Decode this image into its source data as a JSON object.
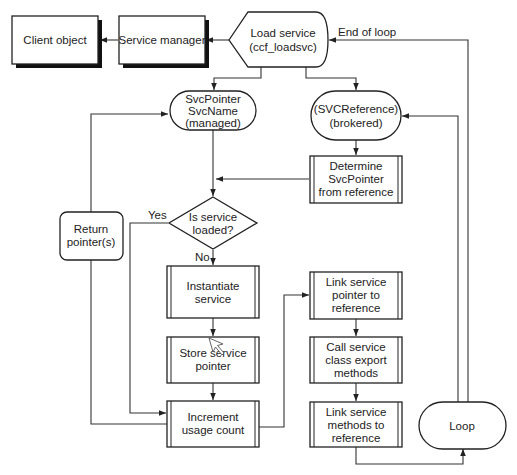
{
  "diagram": {
    "type": "flowchart",
    "nodes": {
      "client_object": {
        "label": "Client object",
        "shape": "shadowed-rectangle"
      },
      "service_manager": {
        "label": "Service manager",
        "shape": "shadowed-rectangle"
      },
      "load_service": {
        "lines": [
          "Load service",
          "(ccf_loadsvc)"
        ],
        "shape": "display"
      },
      "svc_managed": {
        "lines": [
          "SvcPointer",
          "SvcName",
          "(managed)"
        ],
        "shape": "terminator"
      },
      "svc_brokered": {
        "lines": [
          "(SVCReference)",
          "(brokered)"
        ],
        "shape": "terminator"
      },
      "determine_pointer": {
        "lines": [
          "Determine",
          "SvcPointer",
          "from reference"
        ],
        "shape": "predefined-process"
      },
      "is_loaded": {
        "lines": [
          "Is service",
          "loaded?"
        ],
        "shape": "decision"
      },
      "return_pointers": {
        "lines": [
          "Return",
          "pointer(s)"
        ],
        "shape": "rounded-rectangle"
      },
      "instantiate": {
        "lines": [
          "Instantiate",
          "service"
        ],
        "shape": "predefined-process"
      },
      "store_pointer": {
        "lines": [
          "Store service",
          "pointer"
        ],
        "shape": "predefined-process"
      },
      "increment": {
        "lines": [
          "Increment",
          "usage count"
        ],
        "shape": "predefined-process"
      },
      "link_pointer": {
        "lines": [
          "Link service",
          "pointer to",
          "reference"
        ],
        "shape": "predefined-process"
      },
      "call_export": {
        "lines": [
          "Call service",
          "class export",
          "methods"
        ],
        "shape": "predefined-process"
      },
      "link_methods": {
        "lines": [
          "Link service",
          "methods to",
          "reference"
        ],
        "shape": "predefined-process"
      },
      "loop": {
        "label": "Loop",
        "shape": "terminator"
      }
    },
    "edge_labels": {
      "end_of_loop": "End of loop",
      "yes": "Yes",
      "no": "No"
    },
    "edges": [
      [
        "load_service",
        "service_manager"
      ],
      [
        "service_manager",
        "client_object"
      ],
      [
        "load_service",
        "svc_managed"
      ],
      [
        "load_service",
        "svc_brokered"
      ],
      [
        "svc_brokered",
        "determine_pointer"
      ],
      [
        "determine_pointer",
        "is_loaded"
      ],
      [
        "svc_managed",
        "is_loaded"
      ],
      [
        "is_loaded",
        "instantiate",
        "No"
      ],
      [
        "is_loaded",
        "increment",
        "Yes"
      ],
      [
        "instantiate",
        "store_pointer"
      ],
      [
        "store_pointer",
        "increment"
      ],
      [
        "increment",
        "return_pointers"
      ],
      [
        "return_pointers",
        "svc_managed"
      ],
      [
        "increment",
        "link_pointer"
      ],
      [
        "link_pointer",
        "call_export"
      ],
      [
        "call_export",
        "link_methods"
      ],
      [
        "link_methods",
        "loop"
      ],
      [
        "loop",
        "svc_brokered"
      ],
      [
        "loop",
        "load_service",
        "End of loop"
      ]
    ]
  }
}
